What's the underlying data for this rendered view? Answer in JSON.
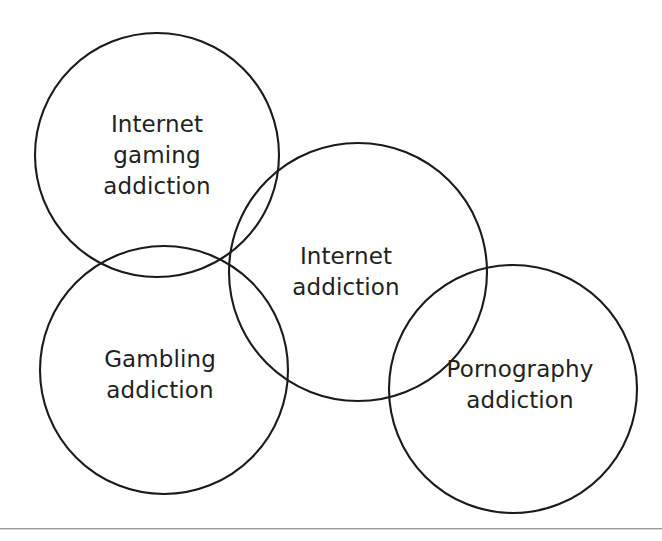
{
  "figure": {
    "background_color": "#ffffff",
    "stroke_color": "#1a1a1a",
    "text_color": "#231f20",
    "rule_color": "#9a9a9a",
    "width": 662,
    "height": 541
  },
  "chart_data": {
    "type": "diagram",
    "diagram_type": "venn",
    "title": "",
    "sets": [
      {
        "id": "internet-gaming-addiction",
        "label": "Internet\ngaming\naddiction",
        "label_lines": [
          "Internet",
          "gaming",
          "addiction"
        ],
        "cx": 157,
        "cy": 155,
        "r": 122,
        "label_x": 157,
        "label_y": 155
      },
      {
        "id": "gambling-addiction",
        "label": "Gambling\naddiction",
        "label_lines": [
          "Gambling",
          "addiction"
        ],
        "cx": 164,
        "cy": 370,
        "r": 124,
        "label_x": 160,
        "label_y": 375
      },
      {
        "id": "internet-addiction",
        "label": "Internet\naddiction",
        "label_lines": [
          "Internet",
          "addiction"
        ],
        "cx": 358,
        "cy": 272,
        "r": 129,
        "label_x": 346,
        "label_y": 272
      },
      {
        "id": "pornography-addiction",
        "label": "Pornography\naddiction",
        "label_lines": [
          "Pornography",
          "addiction"
        ],
        "cx": 513,
        "cy": 389,
        "r": 124,
        "label_x": 520,
        "label_y": 385
      }
    ],
    "overlaps": [
      [
        "internet-gaming-addiction",
        "gambling-addiction"
      ],
      [
        "internet-gaming-addiction",
        "internet-addiction"
      ],
      [
        "gambling-addiction",
        "internet-addiction"
      ],
      [
        "internet-addiction",
        "pornography-addiction"
      ]
    ],
    "legend": null,
    "annotations": []
  },
  "rule": {
    "y": 528
  }
}
